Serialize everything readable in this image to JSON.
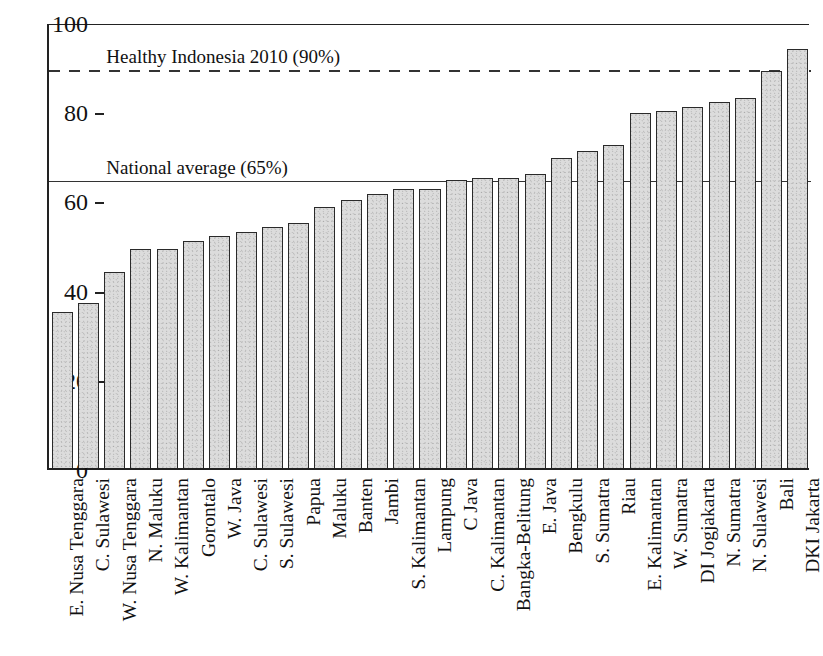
{
  "chart_data": {
    "type": "bar",
    "title": "",
    "subtitle": "",
    "xlabel": "",
    "ylabel": "",
    "ylim": [
      0,
      100
    ],
    "yticks": [
      0,
      20,
      40,
      60,
      80,
      100
    ],
    "grid": false,
    "legend": null,
    "bar_color": "#dcdcdc",
    "bar_edge_color": "#2a2a2a",
    "categories": [
      "E. Nusa Tenggara",
      "C. Sulawesi",
      "W. Nusa Tenggara",
      "N. Maluku",
      "W. Kalimantan",
      "Gorontalo",
      "W. Java",
      "C. Sulawesi",
      "S. Sulawesi",
      "Papua",
      "Maluku",
      "Banten",
      "Jambi",
      "S. Kalimantan",
      "Lampung",
      "C Java",
      "C. Kalimantan",
      "Bangka-Belitung",
      "E. Java",
      "Bengkulu",
      "S. Sumatra",
      "Riau",
      "E. Kalimantan",
      "W. Sumatra",
      "DI Jogjakarta",
      "N. Sumatra",
      "N. Sulawesi",
      "Bali",
      "DKI Jakarta"
    ],
    "values": [
      35,
      37,
      44,
      49,
      49,
      51,
      52,
      53,
      54,
      55,
      58.5,
      60,
      61.5,
      62.5,
      62.5,
      64.5,
      65,
      65,
      66,
      69.5,
      71,
      72.5,
      79.5,
      80,
      81,
      82,
      83,
      89,
      94
    ],
    "annotations": [
      {
        "name": "healthy-indonesia-line",
        "label": "Healthy Indonesia 2010 (90%)",
        "value": 90,
        "line_style": "dashed",
        "label_x_pct": 7
      },
      {
        "name": "national-average-line",
        "label": "National average (65%)",
        "value": 65,
        "line_style": "solid",
        "label_x_pct": 7
      }
    ]
  }
}
